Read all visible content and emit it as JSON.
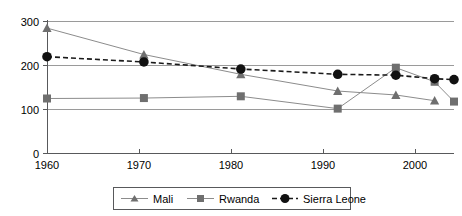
{
  "chart_data": {
    "type": "line",
    "title": "",
    "xlabel": "",
    "ylabel": "",
    "xlim": [
      1960,
      2002
    ],
    "ylim": [
      0,
      300
    ],
    "yticks": [
      0,
      100,
      200,
      300
    ],
    "xticks": [
      1960,
      1970,
      1980,
      1990,
      2000
    ],
    "grid": "horizontal",
    "legend_position": "bottom",
    "series": [
      {
        "name": "Mali",
        "marker": "triangle",
        "line_style": "solid",
        "color": "#8c8c8c",
        "x": [
          1960,
          1970,
          1980,
          1990,
          1996,
          2000
        ],
        "values": [
          285,
          225,
          180,
          142,
          133,
          120
        ]
      },
      {
        "name": "Rwanda",
        "marker": "square",
        "line_style": "solid",
        "color": "#8c8c8c",
        "x": [
          1960,
          1970,
          1980,
          1990,
          1996,
          2000,
          2002
        ],
        "values": [
          125,
          126,
          130,
          102,
          195,
          163,
          118
        ]
      },
      {
        "name": "Sierra Leone",
        "marker": "circle",
        "line_style": "dashed",
        "color": "#1a1a1a",
        "x": [
          1960,
          1970,
          1980,
          1990,
          1996,
          2000,
          2002
        ],
        "values": [
          220,
          208,
          192,
          180,
          178,
          170,
          168
        ]
      }
    ]
  },
  "axis": {
    "y_tick_labels": [
      "300",
      "200",
      "100",
      "0"
    ],
    "x_tick_labels": [
      "1960",
      "1970",
      "1980",
      "1990",
      "2000"
    ]
  },
  "legend": {
    "items": [
      {
        "label": "Mali",
        "marker": "triangle-marker",
        "style": "solid"
      },
      {
        "label": "Rwanda",
        "marker": "square-marker",
        "style": "solid"
      },
      {
        "label": "Sierra Leone",
        "marker": "circle-marker",
        "style": "dashed"
      }
    ]
  }
}
